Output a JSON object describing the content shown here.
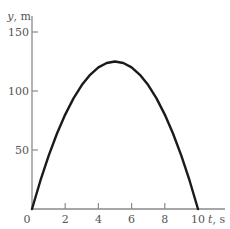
{
  "chart_data": {
    "type": "line",
    "title": "",
    "xlabel": "t, s",
    "ylabel": "y, m",
    "xlabel_var": "t",
    "xlabel_unit": ", s",
    "ylabel_var": "y",
    "ylabel_unit": ", m",
    "xlim": [
      0,
      10
    ],
    "ylim": [
      0,
      150
    ],
    "x_ticks": [
      0,
      2,
      4,
      6,
      8,
      10
    ],
    "y_ticks": [
      50,
      100,
      150
    ],
    "x_tick_labels": [
      "0",
      "2",
      "4",
      "6",
      "8",
      "10"
    ],
    "y_tick_labels": [
      "50",
      "100",
      "150"
    ],
    "grid": false,
    "legend": null,
    "series": [
      {
        "name": "height vs time",
        "x": [
          0,
          0.5,
          1,
          1.5,
          2,
          2.5,
          3,
          3.5,
          4,
          4.5,
          5,
          5.5,
          6,
          6.5,
          7,
          7.5,
          8,
          8.5,
          9,
          9.5,
          10
        ],
        "values": [
          0,
          23.75,
          45,
          63.75,
          80,
          93.75,
          105,
          113.75,
          120,
          123.75,
          125,
          123.75,
          120,
          113.75,
          105,
          93.75,
          80,
          63.75,
          45,
          23.75,
          0
        ]
      }
    ],
    "annotations": [],
    "colors": {
      "curve": "#1a1a1a",
      "axis": "#8a8a8a",
      "text": "#555555"
    }
  },
  "layout": {
    "origin_px": [
      32,
      209
    ],
    "px_per_x_unit": 16.6,
    "px_per_y_unit": 1.18,
    "x_axis_end_px": 225,
    "y_axis_top_px": 16
  }
}
